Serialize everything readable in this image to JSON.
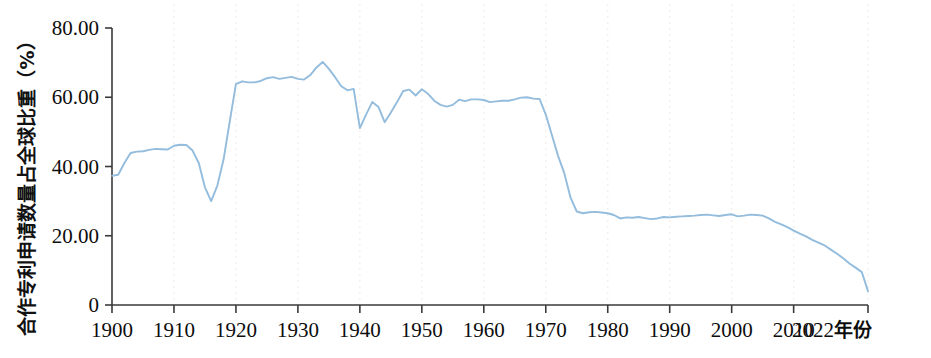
{
  "chart_data": {
    "type": "line",
    "title": "",
    "subtitle": "",
    "xlabel": "2022年份",
    "ylabel": "合作专利申请数量占全球比重（%）",
    "xlim": [
      1900,
      2022
    ],
    "ylim": [
      0,
      80
    ],
    "grid": "vertical-dotted",
    "legend": "none",
    "line_color": "#93bcdd",
    "axis_color": "#3a3a3a",
    "x_tick_labels": [
      "1900",
      "1910",
      "1920",
      "1930",
      "1940",
      "1950",
      "1960",
      "1970",
      "1980",
      "1990",
      "2000",
      "2010",
      "2022年份"
    ],
    "x_tick_values": [
      1900,
      1910,
      1920,
      1930,
      1940,
      1950,
      1960,
      1970,
      1980,
      1990,
      2000,
      2010,
      2022
    ],
    "y_tick_labels": [
      "80.00",
      "60.00",
      "40.00",
      "20.00",
      "0"
    ],
    "y_tick_values": [
      80,
      60,
      40,
      20,
      0
    ],
    "series": [
      {
        "name": "合作专利申请数量占全球比重",
        "color": "#93bcdd",
        "x": [
          1900,
          1901,
          1902,
          1903,
          1904,
          1905,
          1906,
          1907,
          1908,
          1909,
          1910,
          1911,
          1912,
          1913,
          1914,
          1915,
          1916,
          1917,
          1918,
          1919,
          1920,
          1921,
          1922,
          1923,
          1924,
          1925,
          1926,
          1927,
          1928,
          1929,
          1930,
          1931,
          1932,
          1933,
          1934,
          1935,
          1936,
          1937,
          1938,
          1939,
          1940,
          1941,
          1942,
          1943,
          1944,
          1945,
          1946,
          1947,
          1948,
          1949,
          1950,
          1951,
          1952,
          1953,
          1954,
          1955,
          1956,
          1957,
          1958,
          1959,
          1960,
          1961,
          1962,
          1963,
          1964,
          1965,
          1966,
          1967,
          1968,
          1969,
          1970,
          1971,
          1972,
          1973,
          1974,
          1975,
          1976,
          1977,
          1978,
          1979,
          1980,
          1981,
          1982,
          1983,
          1984,
          1985,
          1986,
          1987,
          1988,
          1989,
          1990,
          1991,
          1992,
          1993,
          1994,
          1995,
          1996,
          1997,
          1998,
          1999,
          2000,
          2001,
          2002,
          2003,
          2004,
          2005,
          2006,
          2007,
          2008,
          2009,
          2010,
          2011,
          2012,
          2013,
          2014,
          2015,
          2016,
          2017,
          2018,
          2019,
          2020,
          2021,
          2022
        ],
        "values": [
          37.3,
          37.6,
          41.0,
          43.9,
          44.3,
          44.4,
          44.8,
          45.1,
          45.0,
          44.9,
          46.0,
          46.3,
          46.2,
          44.6,
          41.0,
          34.0,
          30.0,
          34.5,
          42.0,
          53.0,
          63.8,
          64.6,
          64.3,
          64.3,
          64.7,
          65.5,
          65.8,
          65.3,
          65.6,
          65.9,
          65.3,
          65.1,
          66.4,
          68.6,
          70.2,
          68.2,
          65.8,
          63.2,
          62.0,
          62.4,
          51.1,
          55.0,
          58.6,
          57.2,
          52.8,
          55.6,
          58.6,
          61.8,
          62.2,
          60.5,
          62.3,
          61.0,
          59.0,
          57.8,
          57.3,
          57.8,
          59.3,
          58.9,
          59.4,
          59.4,
          59.2,
          58.6,
          58.8,
          59.0,
          59.0,
          59.4,
          59.9,
          60.0,
          59.6,
          59.5,
          55.0,
          49.0,
          43.0,
          38.0,
          31.0,
          27.0,
          26.5,
          26.8,
          26.9,
          26.7,
          26.5,
          26.0,
          25.0,
          25.3,
          25.2,
          25.4,
          25.1,
          24.8,
          25.0,
          25.4,
          25.3,
          25.5,
          25.6,
          25.7,
          25.8,
          26.0,
          26.1,
          25.9,
          25.7,
          26.0,
          26.2,
          25.6,
          25.8,
          26.1,
          26.0,
          25.8,
          25.0,
          24.0,
          23.3,
          22.5,
          21.5,
          20.6,
          19.8,
          18.8,
          18.0,
          17.2,
          16.0,
          14.8,
          13.5,
          12.0,
          10.8,
          9.5,
          4.0
        ]
      }
    ]
  }
}
